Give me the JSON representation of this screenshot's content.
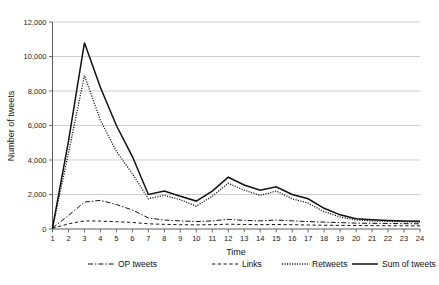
{
  "chart_data": {
    "type": "line",
    "title": "",
    "xlabel": "Time",
    "ylabel": "Number of tweets",
    "x": [
      1,
      2,
      3,
      4,
      5,
      6,
      7,
      8,
      9,
      10,
      11,
      12,
      13,
      14,
      15,
      16,
      17,
      18,
      19,
      20,
      21,
      22,
      23,
      24
    ],
    "xlim": [
      1,
      24
    ],
    "ylim": [
      0,
      12000
    ],
    "yticks": [
      "0",
      "2,000",
      "4,000",
      "6,000",
      "8,000",
      "10,000",
      "12,000"
    ],
    "ytick_values": [
      0,
      2000,
      4000,
      6000,
      8000,
      10000,
      12000
    ],
    "xticks": [
      "1",
      "2",
      "3",
      "4",
      "5",
      "6",
      "7",
      "8",
      "9",
      "10",
      "11",
      "12",
      "13",
      "14",
      "15",
      "16",
      "17",
      "18",
      "19",
      "20",
      "21",
      "22",
      "23",
      "24"
    ],
    "grid": "horizontal",
    "legend_position": "bottom",
    "series": [
      {
        "name": "OP tweets",
        "style": "dash-dot",
        "values": [
          60,
          780,
          1560,
          1660,
          1420,
          1100,
          640,
          520,
          470,
          430,
          470,
          560,
          500,
          470,
          520,
          470,
          430,
          400,
          370,
          340,
          330,
          320,
          310,
          300
        ]
      },
      {
        "name": "Links",
        "style": "dashed",
        "values": [
          40,
          300,
          470,
          460,
          420,
          380,
          300,
          270,
          250,
          240,
          250,
          280,
          260,
          250,
          260,
          250,
          230,
          220,
          210,
          200,
          195,
          190,
          185,
          180
        ]
      },
      {
        "name": "Retweets",
        "style": "dotted",
        "values": [
          40,
          4400,
          8900,
          6300,
          4500,
          3200,
          1750,
          1950,
          1700,
          1320,
          1900,
          2650,
          2250,
          1950,
          2200,
          1750,
          1500,
          1000,
          700,
          520,
          470,
          440,
          420,
          400
        ]
      },
      {
        "name": "Sum of tweets",
        "style": "solid",
        "values": [
          60,
          5100,
          10800,
          8200,
          6000,
          4200,
          2000,
          2200,
          1900,
          1620,
          2200,
          3000,
          2550,
          2250,
          2450,
          2000,
          1750,
          1200,
          820,
          600,
          540,
          500,
          470,
          450
        ]
      }
    ],
    "legend": [
      {
        "label": "OP tweets",
        "style": "dash-dot"
      },
      {
        "label": "Links",
        "style": "dashed"
      },
      {
        "label": "Retweets",
        "style": "dotted"
      },
      {
        "label": "Sum of tweets",
        "style": "solid"
      }
    ]
  }
}
